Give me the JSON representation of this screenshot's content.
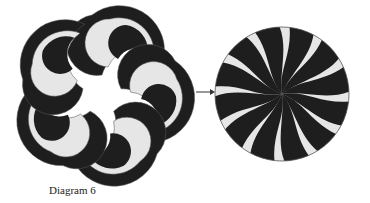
{
  "caption": "Diagram 6",
  "colors": {
    "dark": "#1e1e1e",
    "light": "#e6e6e6",
    "outline": "#555555",
    "background": "#ffffff"
  },
  "left_figure": {
    "description": "six crescent swirl pieces separated",
    "pieces": 6
  },
  "right_figure": {
    "description": "pinwheel circle with 12 alternating swirl stripes",
    "stripes": 12
  },
  "arrow": {
    "direction": "right"
  }
}
